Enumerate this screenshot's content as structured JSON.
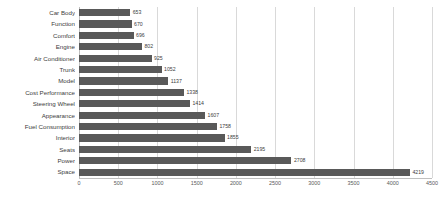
{
  "chart_data": {
    "type": "bar",
    "orientation": "horizontal",
    "title": "",
    "subtitle": "",
    "xlabel": "",
    "ylabel": "",
    "xlim": [
      0,
      4500
    ],
    "xticks": [
      0,
      500,
      1000,
      1500,
      2000,
      2500,
      3000,
      3500,
      4000,
      4500
    ],
    "grid": true,
    "legend": false,
    "bar_color": "#595959",
    "grid_color": "#d9d9d9",
    "axis_color": "#bfbfbf",
    "label_color": "#404040",
    "categories": [
      "Car Body",
      "Function",
      "Comfort",
      "Engine",
      "Air Conditioner",
      "Trunk",
      "Model",
      "Cost Performance",
      "Steering Wheel",
      "Appearance",
      "Fuel Consumption",
      "Interior",
      "Seats",
      "Power",
      "Space"
    ],
    "values": [
      653,
      670,
      696,
      802,
      925,
      1052,
      1137,
      1338,
      1414,
      1607,
      1758,
      1855,
      2195,
      2708,
      4219
    ],
    "data_labels": [
      "653",
      "670",
      "696",
      "802",
      "925",
      "1052",
      "1137",
      "1338",
      "1414",
      "1607",
      "1758",
      "1855",
      "2195",
      "2708",
      "4219"
    ],
    "tick_labels": [
      "0",
      "500",
      "1000",
      "1500",
      "2000",
      "2500",
      "3000",
      "3500",
      "4000",
      "4500"
    ]
  }
}
